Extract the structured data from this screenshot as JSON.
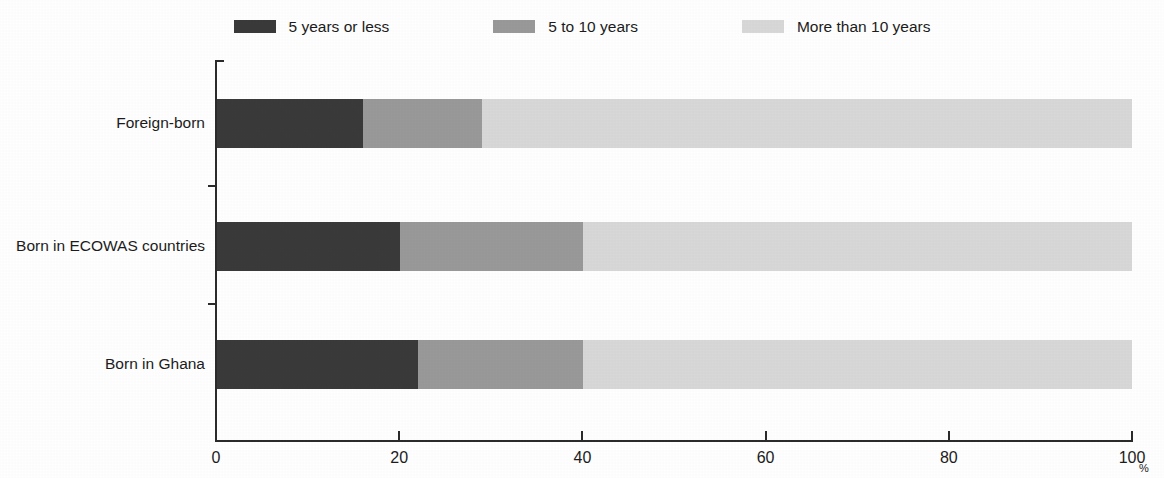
{
  "chart_data": {
    "type": "bar",
    "orientation": "horizontal",
    "stacked": true,
    "normalized": true,
    "title": "",
    "subtitle": "",
    "xlabel": "",
    "ylabel": "",
    "axis_unit": "%",
    "xlim": [
      0,
      100
    ],
    "xticks": [
      0,
      20,
      40,
      60,
      80,
      100
    ],
    "xtick_labels": [
      "0",
      "20",
      "40",
      "60",
      "80",
      "100"
    ],
    "grid": false,
    "legend_position": "top-center",
    "categories": [
      "Foreign-born",
      "Born in ECOWAS countries",
      "Born in Ghana"
    ],
    "series": [
      {
        "name": "5 years or less",
        "color": "#3a3a3a",
        "values": [
          16,
          20,
          22
        ]
      },
      {
        "name": "5 to 10 years",
        "color": "#999999",
        "values": [
          13,
          20,
          18
        ]
      },
      {
        "name": "More than 10 years",
        "color": "#d8d8d8",
        "values": [
          71,
          60,
          60
        ]
      }
    ]
  },
  "legend": {
    "items": [
      {
        "label": "5 years or less",
        "color": "#3a3a3a"
      },
      {
        "label": "5 to 10 years",
        "color": "#999999"
      },
      {
        "label": "More than 10 years",
        "color": "#d8d8d8"
      }
    ]
  },
  "axis": {
    "unit": "%",
    "ticks": [
      {
        "label": "0",
        "value": 0
      },
      {
        "label": "20",
        "value": 20
      },
      {
        "label": "40",
        "value": 40
      },
      {
        "label": "60",
        "value": 60
      },
      {
        "label": "80",
        "value": 80
      },
      {
        "label": "100",
        "value": 100
      }
    ]
  },
  "categories": [
    {
      "label": "Foreign-born"
    },
    {
      "label": "Born in ECOWAS countries"
    },
    {
      "label": "Born in Ghana"
    }
  ]
}
